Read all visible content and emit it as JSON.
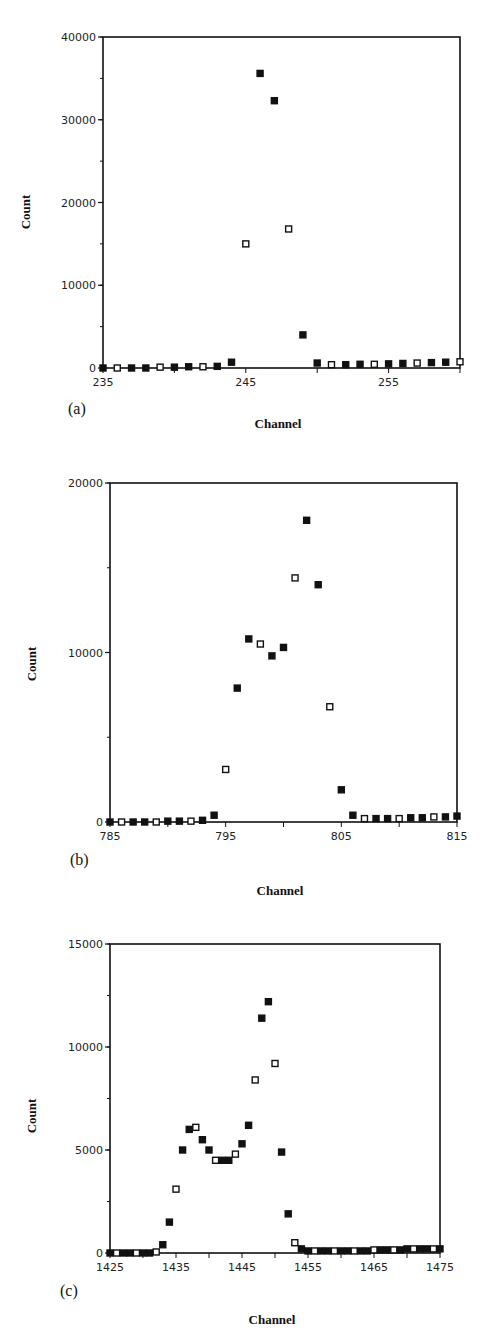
{
  "figure": {
    "panels": [
      {
        "id": "a",
        "label": "(a)",
        "xlabel": "Channel",
        "ylabel": "Count"
      },
      {
        "id": "b",
        "label": "(b)",
        "xlabel": "Channel",
        "ylabel": "Count"
      },
      {
        "id": "c",
        "label": "(c)",
        "xlabel": "Channel",
        "ylabel": "Count"
      }
    ]
  },
  "chart_data": [
    {
      "type": "scatter",
      "panel": "(a)",
      "title": "",
      "xlabel": "Channel",
      "ylabel": "Count",
      "xlim": [
        235,
        260
      ],
      "ylim": [
        0,
        40000
      ],
      "xticks": [
        235,
        245,
        255
      ],
      "yticks": [
        0,
        10000,
        20000,
        30000,
        40000
      ],
      "grid": false,
      "legend": null,
      "marker": "square",
      "x": [
        235,
        236,
        237,
        238,
        239,
        240,
        241,
        242,
        243,
        244,
        245,
        246,
        247,
        248,
        249,
        250,
        251,
        252,
        253,
        254,
        255,
        256,
        257,
        258,
        259,
        260
      ],
      "y": [
        0,
        0,
        0,
        0,
        100,
        100,
        150,
        150,
        200,
        700,
        15000,
        35600,
        32300,
        16800,
        4000,
        600,
        400,
        400,
        450,
        450,
        500,
        550,
        600,
        650,
        700,
        750
      ]
    },
    {
      "type": "scatter",
      "panel": "(b)",
      "title": "",
      "xlabel": "Channel",
      "ylabel": "Count",
      "xlim": [
        785,
        815
      ],
      "ylim": [
        0,
        20000
      ],
      "xticks": [
        785,
        795,
        805,
        815
      ],
      "yticks": [
        0,
        10000,
        20000
      ],
      "grid": false,
      "legend": null,
      "marker": "square",
      "x": [
        785,
        786,
        787,
        788,
        789,
        790,
        791,
        792,
        793,
        794,
        795,
        796,
        797,
        798,
        799,
        800,
        801,
        802,
        803,
        804,
        805,
        806,
        807,
        808,
        809,
        810,
        811,
        812,
        813,
        814,
        815
      ],
      "y": [
        0,
        0,
        0,
        0,
        0,
        50,
        50,
        50,
        100,
        400,
        3100,
        7900,
        10800,
        10500,
        9800,
        10300,
        14400,
        17800,
        14000,
        6800,
        1900,
        400,
        200,
        200,
        200,
        200,
        250,
        250,
        300,
        300,
        350
      ]
    },
    {
      "type": "scatter",
      "panel": "(c)",
      "title": "",
      "xlabel": "Channel",
      "ylabel": "Count",
      "xlim": [
        1425,
        1475
      ],
      "ylim": [
        0,
        15000
      ],
      "xticks": [
        1425,
        1435,
        1445,
        1455,
        1465,
        1475
      ],
      "yticks": [
        0,
        5000,
        10000,
        15000
      ],
      "grid": false,
      "legend": null,
      "marker": "square",
      "x": [
        1425,
        1426,
        1427,
        1428,
        1429,
        1430,
        1431,
        1432,
        1433,
        1434,
        1435,
        1436,
        1437,
        1438,
        1439,
        1440,
        1441,
        1442,
        1443,
        1444,
        1445,
        1446,
        1447,
        1448,
        1449,
        1450,
        1451,
        1452,
        1453,
        1454,
        1455,
        1456,
        1457,
        1458,
        1459,
        1460,
        1461,
        1462,
        1463,
        1464,
        1465,
        1466,
        1467,
        1468,
        1469,
        1470,
        1471,
        1472,
        1473,
        1474,
        1475
      ],
      "y": [
        0,
        0,
        0,
        0,
        0,
        0,
        0,
        50,
        400,
        1500,
        3100,
        5000,
        6000,
        6100,
        5500,
        5000,
        4500,
        4500,
        4500,
        4800,
        5300,
        6200,
        8400,
        11400,
        12200,
        9200,
        4900,
        1900,
        500,
        200,
        100,
        100,
        100,
        100,
        100,
        100,
        100,
        100,
        100,
        100,
        150,
        150,
        150,
        150,
        150,
        200,
        200,
        200,
        200,
        200,
        200
      ]
    }
  ]
}
